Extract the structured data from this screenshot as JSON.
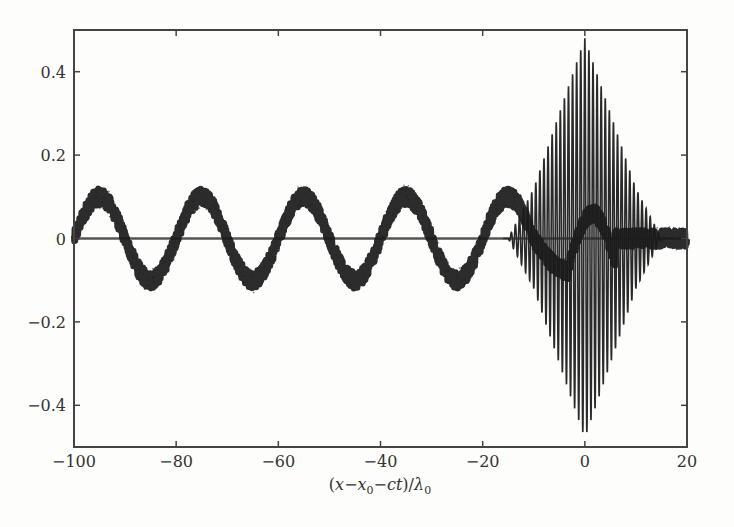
{
  "chart_data": {
    "type": "line",
    "title": "",
    "xlabel": "(x−x₀−ct)/λ₀",
    "xlabel_parts": {
      "open": "(",
      "x": "x",
      "minus1": "−",
      "x0": "x",
      "sub0": "0",
      "minus2": "−",
      "ct": "ct",
      "close": ")/",
      "lambda": "λ",
      "sub1": "0"
    },
    "ylabel": "",
    "xlim": [
      -100,
      20
    ],
    "ylim": [
      -0.5,
      0.5
    ],
    "xticks": [
      -100,
      -80,
      -60,
      -40,
      -20,
      0,
      20
    ],
    "xtick_labels": [
      "−100",
      "−80",
      "−60",
      "−40",
      "−20",
      "0",
      "20"
    ],
    "yticks": [
      -0.4,
      -0.2,
      0,
      0.2,
      0.4
    ],
    "ytick_labels": [
      "−0.4",
      "−0.2",
      "0",
      "0.2",
      "0.4"
    ],
    "grid": false,
    "legend": null,
    "series": [
      {
        "name": "wake field (noisy sinusoid)",
        "description": "Noisy sinusoidal wake of amplitude ~0.1 and period ~20, present behind the pulse",
        "amplitude": 0.1,
        "period": 20,
        "crest_x": [
          -95,
          -75,
          -55,
          -35,
          -15
        ],
        "trough_x": [
          -85,
          -65,
          -45,
          -25,
          -5
        ],
        "x": [
          -100,
          -95,
          -90,
          -85,
          -80,
          -75,
          -70,
          -65,
          -60,
          -55,
          -50,
          -45,
          -40,
          -35,
          -30,
          -25,
          -20,
          -15,
          -10,
          -5,
          0,
          5,
          10,
          15,
          20
        ],
        "values": [
          -0.02,
          0.1,
          0.0,
          -0.1,
          0.0,
          0.1,
          0.0,
          -0.1,
          0.0,
          0.1,
          0.0,
          -0.1,
          0.0,
          0.1,
          0.0,
          -0.1,
          0.0,
          0.1,
          0.0,
          -0.08,
          0.06,
          0.02,
          0.0,
          0.0,
          0.0
        ],
        "color": "#1a1a1a"
      },
      {
        "name": "laser pulse (oscillating envelope)",
        "description": "Fast-oscillating pulse with roughly triangular envelope centered near x=0, peak amplitude ~0.48",
        "center": 0,
        "peak_amplitude": 0.48,
        "envelope_x": [
          -15,
          -10,
          -5,
          0,
          5,
          10,
          15
        ],
        "envelope_values": [
          0.0,
          0.12,
          0.3,
          0.48,
          0.3,
          0.12,
          0.0
        ],
        "color": "#2a2a2a"
      },
      {
        "name": "reference zero line",
        "x": [
          -100,
          20
        ],
        "values": [
          0,
          0
        ],
        "color": "#555555"
      }
    ]
  }
}
